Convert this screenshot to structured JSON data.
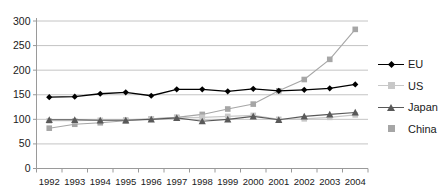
{
  "chart_data": {
    "type": "line",
    "title": "",
    "subtitle": "",
    "xlabel": "",
    "ylabel": "",
    "categories": [
      "1992",
      "1993",
      "1994",
      "1995",
      "1996",
      "1997",
      "1998",
      "1999",
      "2000",
      "2001",
      "2002",
      "2003",
      "2004"
    ],
    "x": [
      1992,
      1993,
      1994,
      1995,
      1996,
      1997,
      1998,
      1999,
      2000,
      2001,
      2002,
      2003,
      2004
    ],
    "ylim": [
      0,
      300
    ],
    "y_ticks": [
      0,
      50,
      100,
      150,
      200,
      250,
      300
    ],
    "y_tick_labels": [
      "0",
      "50",
      "100",
      "150",
      "200",
      "250",
      "300"
    ],
    "grid": true,
    "grid_axis": "y",
    "legend_position": "right",
    "series": [
      {
        "name": "EU",
        "color": "#000000",
        "marker": "diamond",
        "values": [
          145,
          146,
          152,
          155,
          148,
          161,
          161,
          157,
          162,
          158,
          160,
          163,
          171
        ]
      },
      {
        "name": "US",
        "color": "#c8c8c8",
        "marker": "square",
        "values": [
          97,
          97,
          98,
          99,
          101,
          103,
          104,
          106,
          108,
          100,
          101,
          104,
          109
        ]
      },
      {
        "name": "Japan",
        "color": "#595959",
        "marker": "triangle",
        "values": [
          99,
          99,
          98,
          98,
          100,
          103,
          96,
          100,
          106,
          99,
          106,
          110,
          114
        ]
      },
      {
        "name": "China",
        "color": "#a6a6a6",
        "marker": "square",
        "values": [
          82,
          90,
          93,
          97,
          101,
          104,
          110,
          121,
          131,
          158,
          181,
          222,
          283
        ]
      }
    ],
    "legend": [
      {
        "label": "EU",
        "color": "#000000",
        "marker": "diamond",
        "show_line": true
      },
      {
        "label": "US",
        "color": "#c8c8c8",
        "marker": "square",
        "show_line": true
      },
      {
        "label": "Japan",
        "color": "#595959",
        "marker": "triangle",
        "show_line": true
      },
      {
        "label": "China",
        "color": "#a6a6a6",
        "marker": "square",
        "show_line": false
      }
    ]
  },
  "colors": {
    "axis": "#9a9a9a",
    "grid": "#b5b5b5",
    "text": "#1a1a1a",
    "background": "#ffffff"
  }
}
